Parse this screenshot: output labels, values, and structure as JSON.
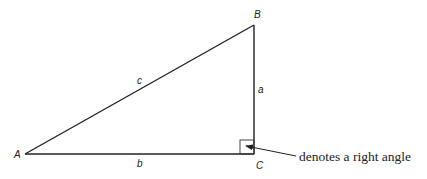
{
  "diagram": {
    "type": "right-triangle",
    "vertices": {
      "A": {
        "label": "A",
        "x": 25,
        "y": 154
      },
      "B": {
        "label": "B",
        "x": 254,
        "y": 25
      },
      "C": {
        "label": "C",
        "x": 254,
        "y": 154
      }
    },
    "sides": {
      "a": {
        "label": "a",
        "between": [
          "B",
          "C"
        ]
      },
      "b": {
        "label": "b",
        "between": [
          "A",
          "C"
        ]
      },
      "c": {
        "label": "c",
        "between": [
          "A",
          "B"
        ]
      }
    },
    "right_angle_at": "C",
    "annotation": {
      "text": "denotes a right angle",
      "points_to": "right-angle-marker"
    },
    "colors": {
      "line": "#222222",
      "background": "#ffffff"
    }
  }
}
